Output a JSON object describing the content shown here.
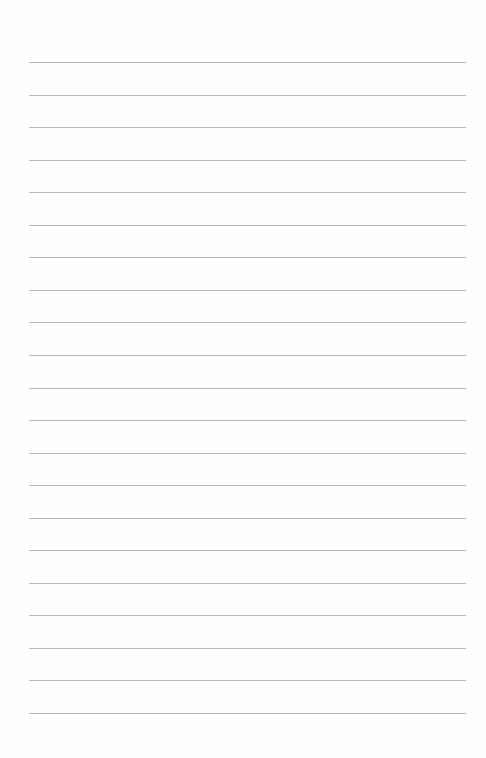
{
  "page": {
    "type": "lined-paper",
    "background": "#fefefe",
    "line_color": "#b8b8b8",
    "line_count": 21,
    "first_line_y": 62,
    "line_spacing": 32.55,
    "line_left": 29,
    "line_width": 437
  }
}
